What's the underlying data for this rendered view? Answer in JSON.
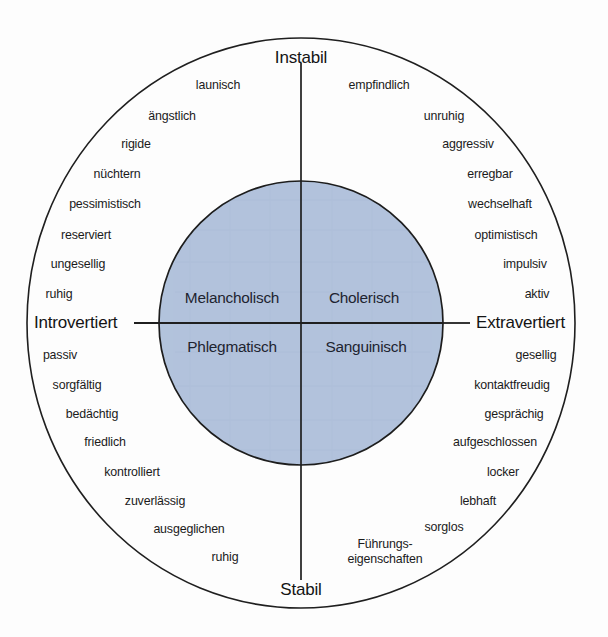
{
  "figure": {
    "colors": {
      "inner_circle_fill": "#b2c3dc",
      "line": "#1f1f1f",
      "text": "#1b1b1b",
      "background": "#fdfdfd"
    },
    "geometry": {
      "outer_circle": {
        "cx": 301,
        "cy": 323,
        "rx": 274,
        "ry": 285
      },
      "inner_circle": {
        "cx": 301,
        "cy": 323,
        "r": 142
      }
    }
  },
  "axes": {
    "top": "Instabil",
    "bottom": "Stabil",
    "left": "Introvertiert",
    "right": "Extravertiert"
  },
  "quadrants": [
    {
      "name": "melancholic",
      "label": "Melancholisch",
      "position": "top-left"
    },
    {
      "name": "choleric",
      "label": "Cholerisch",
      "position": "top-right"
    },
    {
      "name": "phlegmatic",
      "label": "Phlegmatisch",
      "position": "bottom-left"
    },
    {
      "name": "sanguine",
      "label": "Sanguinisch",
      "position": "bottom-right"
    }
  ],
  "traits": {
    "melancholic": [
      {
        "label": "launisch",
        "x": 218,
        "y": 86,
        "anchor": "center"
      },
      {
        "label": "ängstlich",
        "x": 172,
        "y": 117,
        "anchor": "center"
      },
      {
        "label": "rigide",
        "x": 136,
        "y": 145,
        "anchor": "center"
      },
      {
        "label": "nüchtern",
        "x": 117,
        "y": 175,
        "anchor": "center"
      },
      {
        "label": "pessimistisch",
        "x": 105,
        "y": 205,
        "anchor": "center"
      },
      {
        "label": "reserviert",
        "x": 86,
        "y": 236,
        "anchor": "center"
      },
      {
        "label": "ungesellig",
        "x": 78,
        "y": 265,
        "anchor": "center"
      },
      {
        "label": "ruhig",
        "x": 59,
        "y": 295,
        "anchor": "center"
      }
    ],
    "choleric": [
      {
        "label": "empfindlich",
        "x": 379,
        "y": 86,
        "anchor": "center"
      },
      {
        "label": "unruhig",
        "x": 444,
        "y": 117,
        "anchor": "center"
      },
      {
        "label": "aggressiv",
        "x": 468,
        "y": 145,
        "anchor": "center"
      },
      {
        "label": "erregbar",
        "x": 490,
        "y": 175,
        "anchor": "center"
      },
      {
        "label": "wechselhaft",
        "x": 500,
        "y": 205,
        "anchor": "center"
      },
      {
        "label": "optimistisch",
        "x": 506,
        "y": 236,
        "anchor": "center"
      },
      {
        "label": "impulsiv",
        "x": 525,
        "y": 265,
        "anchor": "center"
      },
      {
        "label": "aktiv",
        "x": 537,
        "y": 295,
        "anchor": "center"
      }
    ],
    "phlegmatic": [
      {
        "label": "passiv",
        "x": 60,
        "y": 356,
        "anchor": "center"
      },
      {
        "label": "sorgfältig",
        "x": 77,
        "y": 386,
        "anchor": "center"
      },
      {
        "label": "bedächtig",
        "x": 92,
        "y": 415,
        "anchor": "center"
      },
      {
        "label": "friedlich",
        "x": 105,
        "y": 443,
        "anchor": "center"
      },
      {
        "label": "kontrolliert",
        "x": 132,
        "y": 473,
        "anchor": "center"
      },
      {
        "label": "zuverlässig",
        "x": 155,
        "y": 502,
        "anchor": "center"
      },
      {
        "label": "ausgeglichen",
        "x": 189,
        "y": 530,
        "anchor": "center"
      },
      {
        "label": "ruhig",
        "x": 225,
        "y": 558,
        "anchor": "center"
      }
    ],
    "sanguine": [
      {
        "label": "gesellig",
        "x": 536,
        "y": 356,
        "anchor": "center"
      },
      {
        "label": "kontaktfreudig",
        "x": 512,
        "y": 386,
        "anchor": "center"
      },
      {
        "label": "gesprächig",
        "x": 514,
        "y": 415,
        "anchor": "center"
      },
      {
        "label": "aufgeschlossen",
        "x": 495,
        "y": 443,
        "anchor": "center"
      },
      {
        "label": "locker",
        "x": 503,
        "y": 473,
        "anchor": "center"
      },
      {
        "label": "lebhaft",
        "x": 478,
        "y": 502,
        "anchor": "center"
      },
      {
        "label": "sorglos",
        "x": 444,
        "y": 528,
        "anchor": "center"
      },
      {
        "label": "Führungs-\neigenschaften",
        "x": 385,
        "y": 551,
        "anchor": "center",
        "multiline": true
      }
    ]
  }
}
